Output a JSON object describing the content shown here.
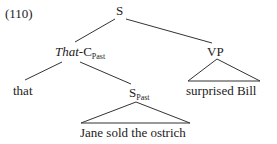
{
  "example_number": "(110)",
  "nodes": {
    "root": {
      "label": "S"
    },
    "that_c": {
      "label_italic": "That",
      "label_rest": "-C",
      "subscript": "Past"
    },
    "vp": {
      "label": "VP"
    },
    "that_leaf": {
      "label": "that"
    },
    "s_past": {
      "label": "S",
      "subscript": "Past"
    }
  },
  "terminals": {
    "vp_yield": "surprised Bill",
    "s_past_yield": "Jane sold the ostrich"
  },
  "colors": {
    "ink": "#222222",
    "line": "#333333",
    "background": "#ffffff"
  }
}
